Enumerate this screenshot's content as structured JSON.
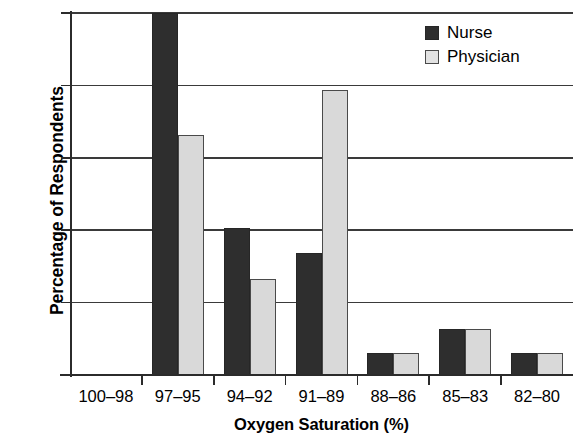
{
  "chart_data": {
    "type": "bar",
    "title": "",
    "xlabel": "Oxygen Saturation (%)",
    "ylabel": "Percentage of Respondents",
    "categories": [
      "100–98",
      "97–95",
      "94–92",
      "91–89",
      "88–86",
      "85–83",
      "82–80"
    ],
    "series": [
      {
        "name": "Nurse",
        "color": "#2e2e2e",
        "values": [
          0,
          50,
          20.3,
          16.8,
          3.0,
          6.3,
          3.0
        ]
      },
      {
        "name": "Physician",
        "color": "#d9d9d9",
        "values": [
          0,
          33.1,
          13.3,
          39.4,
          3.0,
          6.4,
          3.0
        ]
      }
    ],
    "ylim": [
      0,
      50
    ],
    "yticks": [
      0,
      10,
      20,
      30,
      40,
      50
    ],
    "ytick_labels": [
      "0",
      "10",
      "20",
      "30",
      "40",
      "50"
    ],
    "grid": "horizontal",
    "legend_position": "top-right-inside"
  },
  "legend": {
    "items": [
      {
        "label": "Nurse",
        "swatch": "dark-square-swatch"
      },
      {
        "label": "Physician",
        "swatch": "light-square-swatch"
      }
    ]
  }
}
